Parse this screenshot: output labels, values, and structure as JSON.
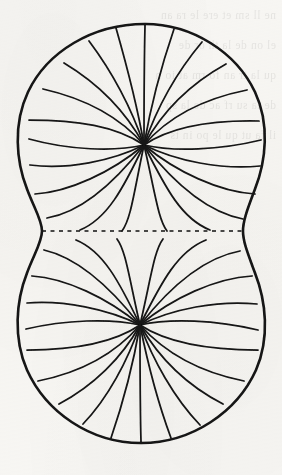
{
  "figure": {
    "kind": "line-drawing",
    "canvas": {
      "width": 282,
      "height": 475
    },
    "medium": "ink on off-white scanned paper with reverse-side show-through",
    "colors": {
      "paper": "#f7f6f3",
      "ink": "#141414",
      "showthrough_ink": "#2b2b2b"
    },
    "stroke_widths": {
      "outline": 2.6,
      "field_line": 1.75,
      "dashed_waist": 1.5
    },
    "geometry": {
      "top_lobe": {
        "focus": {
          "x": 144,
          "y": 145
        },
        "top_y": 24,
        "left_x": 27,
        "right_x": 262,
        "widest_y": 132,
        "field_line_count": 20
      },
      "bottom_lobe": {
        "focus": {
          "x": 140,
          "y": 325
        },
        "bottom_y": 443,
        "left_x": 26,
        "right_x": 261,
        "widest_y": 336,
        "field_line_count": 20
      },
      "waist": {
        "y": 231,
        "left_x": 42,
        "right_x": 243,
        "half_width": 100
      }
    },
    "dashed_waist_line": {
      "y": 231,
      "x_start": 42,
      "x_end": 243,
      "dash_length": 4,
      "gap_length": 4.5
    }
  },
  "showthrough_lines": [
    "",
    "",
    "",
    "",
    "ne ll  sm et ere  le ra  an",
    "",
    "el on  de  la  th or  de",
    "",
    "",
    "qu  la  tr an  fo rm at io n",
    "",
    "",
    "",
    "de  la  su rf ac  de  la  sp",
    "",
    "",
    "il  fa ut  qu  le  po in ts"
  ]
}
